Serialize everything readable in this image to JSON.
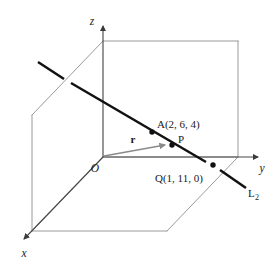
{
  "figure": {
    "type": "3d-line-geometry-diagram",
    "background_color": "#ffffff",
    "box_edge_color": "#8a8a8a",
    "axis_color": "#555555",
    "line_color": "#111111",
    "vector_color": "#8a8a8a",
    "point_color": "#111111"
  },
  "axes": {
    "z_label": "z",
    "y_label": "y",
    "x_label": "x",
    "origin_label": "O"
  },
  "points": [
    {
      "name": "point-a",
      "label": "A(2, 6, 4)",
      "x": 2,
      "y": 6,
      "z": 4,
      "px": 152,
      "py": 132
    },
    {
      "name": "point-p",
      "label": "P",
      "px": 172,
      "py": 145
    },
    {
      "name": "point-q",
      "label": "Q(1, 11, 0)",
      "x": 1,
      "y": 11,
      "z": 0,
      "px": 213,
      "py": 165
    }
  ],
  "vectors": [
    {
      "name": "position-vector-r",
      "label": "r",
      "from": "O",
      "to": "P"
    }
  ],
  "lines": [
    {
      "name": "line-l2",
      "label": "L",
      "subscript": "2",
      "through": [
        "A",
        "P",
        "Q"
      ]
    }
  ]
}
